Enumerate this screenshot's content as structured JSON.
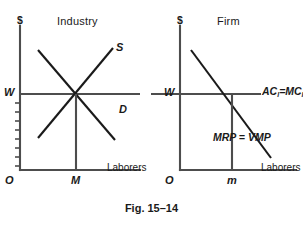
{
  "figure": {
    "caption": "Fig. 15–14"
  },
  "panels": [
    {
      "id": "industry",
      "title": "Industry",
      "y_axis_symbol": "$",
      "x_axis_label": "Laborers",
      "origin_label": "O",
      "wage_label": "W",
      "quantity_label": "M",
      "curves": [
        {
          "name": "supply",
          "label": "S"
        },
        {
          "name": "demand",
          "label": "D"
        }
      ]
    },
    {
      "id": "firm",
      "title": "Firm",
      "y_axis_symbol": "$",
      "x_axis_label": "Laborers",
      "origin_label": "O",
      "wage_label": "W",
      "quantity_label": "m",
      "curves": [
        {
          "name": "marginal-cost",
          "label_ac": "AC",
          "label_sep": "=",
          "label_mc": "MC",
          "subscript": "l"
        },
        {
          "name": "marginal-revenue-product",
          "label": "MRP = VMP"
        }
      ]
    }
  ],
  "colors": {
    "ink": "#1a1a1a",
    "axis": "#4d4d4d",
    "background": "#ffffff"
  }
}
